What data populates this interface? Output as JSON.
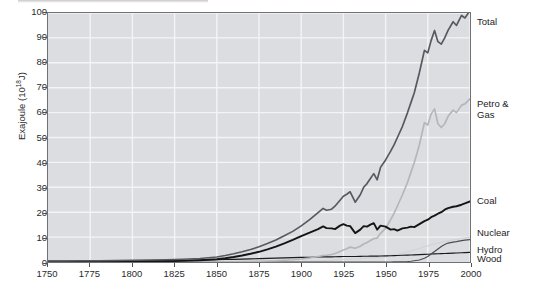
{
  "chart_data": {
    "type": "line",
    "title": "",
    "xlabel": "",
    "ylabel": "Exajoule (10",
    "ylabel_exponent": "18",
    "ylabel_suffix": "J)",
    "xlim": [
      1750,
      2000
    ],
    "ylim": [
      0,
      100
    ],
    "grid": true,
    "legend_position": "right-of-axes",
    "xticks": [
      "1750",
      "1775",
      "1800",
      "1825",
      "1850",
      "1875",
      "1900",
      "1925",
      "1950",
      "1975",
      "2000"
    ],
    "yticks": [
      "0",
      "10",
      "20",
      "30",
      "40",
      "50",
      "60",
      "70",
      "80",
      "90",
      "100"
    ],
    "x": [
      1750,
      1760,
      1770,
      1780,
      1790,
      1800,
      1810,
      1820,
      1830,
      1840,
      1850,
      1855,
      1860,
      1865,
      1870,
      1875,
      1880,
      1885,
      1890,
      1895,
      1900,
      1905,
      1910,
      1913,
      1915,
      1918,
      1920,
      1923,
      1925,
      1927,
      1929,
      1932,
      1935,
      1937,
      1939,
      1941,
      1943,
      1945,
      1947,
      1950,
      1953,
      1955,
      1957,
      1960,
      1963,
      1965,
      1967,
      1970,
      1973,
      1975,
      1977,
      1979,
      1981,
      1983,
      1985,
      1987,
      1990,
      1992,
      1995,
      1997,
      2000
    ],
    "series": [
      {
        "name": "Total",
        "color": "#565a60",
        "width": 1.7,
        "values": [
          0.4,
          0.4,
          0.5,
          0.5,
          0.6,
          0.7,
          0.8,
          0.9,
          1.1,
          1.4,
          2.0,
          2.6,
          3.3,
          4.1,
          5.0,
          6.1,
          7.4,
          8.8,
          10.5,
          12.3,
          14.5,
          17.0,
          19.8,
          21.5,
          20.8,
          21.2,
          22.4,
          24.8,
          26.4,
          27.2,
          28.2,
          24.0,
          27.0,
          30.0,
          31.5,
          33.5,
          35.5,
          33.0,
          38.0,
          41.0,
          44.5,
          47.0,
          50.0,
          54.5,
          60.0,
          64.0,
          68.0,
          76.0,
          85.0,
          84.0,
          89.0,
          93.0,
          88.5,
          87.5,
          90.0,
          93.0,
          96.5,
          95.0,
          99.0,
          98.0,
          101.0
        ]
      },
      {
        "name": "Petro & Gas",
        "color": "#b4b6ba",
        "width": 1.7,
        "values": [
          0,
          0,
          0,
          0,
          0,
          0,
          0,
          0,
          0,
          0,
          0.02,
          0.05,
          0.1,
          0.15,
          0.2,
          0.3,
          0.4,
          0.5,
          0.7,
          0.9,
          1.2,
          1.6,
          2.2,
          2.6,
          2.7,
          3.0,
          3.4,
          4.2,
          4.8,
          5.3,
          6.0,
          5.5,
          6.3,
          7.2,
          7.8,
          8.6,
          9.4,
          9.6,
          11.5,
          13.5,
          17.0,
          19.5,
          22.5,
          27.0,
          32.0,
          36.0,
          40.0,
          47.0,
          56.0,
          55.0,
          59.5,
          61.5,
          55.5,
          54.0,
          55.5,
          58.5,
          61.0,
          60.0,
          63.0,
          63.5,
          65.5
        ]
      },
      {
        "name": "Coal",
        "color": "#151515",
        "width": 1.9,
        "values": [
          0.05,
          0.06,
          0.08,
          0.1,
          0.12,
          0.16,
          0.22,
          0.3,
          0.45,
          0.7,
          1.1,
          1.5,
          2.0,
          2.6,
          3.3,
          4.1,
          5.1,
          6.2,
          7.5,
          8.9,
          10.4,
          11.8,
          13.2,
          14.3,
          13.6,
          13.5,
          13.2,
          14.6,
          15.2,
          14.6,
          14.4,
          11.6,
          13.0,
          14.4,
          14.2,
          15.0,
          15.6,
          13.0,
          14.6,
          14.2,
          13.0,
          13.2,
          12.6,
          13.5,
          13.8,
          14.2,
          14.0,
          15.2,
          16.4,
          17.0,
          18.0,
          18.6,
          19.4,
          20.0,
          21.0,
          21.6,
          22.2,
          22.4,
          23.0,
          23.5,
          24.3
        ]
      },
      {
        "name": "Nuclear",
        "color": "#4a4c50",
        "width": 1.2,
        "values": [
          0,
          0,
          0,
          0,
          0,
          0,
          0,
          0,
          0,
          0,
          0,
          0,
          0,
          0,
          0,
          0,
          0,
          0,
          0,
          0,
          0,
          0,
          0,
          0,
          0,
          0,
          0,
          0,
          0,
          0,
          0,
          0,
          0,
          0,
          0,
          0,
          0,
          0,
          0,
          0,
          0,
          0.02,
          0.05,
          0.1,
          0.2,
          0.3,
          0.5,
          0.8,
          1.5,
          2.2,
          3.2,
          4.2,
          5.2,
          6.2,
          7.0,
          7.6,
          8.0,
          8.2,
          8.6,
          8.8,
          9.0
        ]
      },
      {
        "name": "Hydro",
        "color": "#d3d4d7",
        "width": 1.3,
        "values": [
          0,
          0,
          0,
          0,
          0,
          0,
          0,
          0,
          0,
          0,
          0,
          0,
          0,
          0,
          0,
          0,
          0,
          0.02,
          0.05,
          0.1,
          0.2,
          0.3,
          0.45,
          0.55,
          0.6,
          0.7,
          0.8,
          0.95,
          1.05,
          1.15,
          1.25,
          1.2,
          1.35,
          1.5,
          1.6,
          1.7,
          1.8,
          1.8,
          2.0,
          2.2,
          2.6,
          2.9,
          3.2,
          3.6,
          4.1,
          4.5,
          4.9,
          5.4,
          6.1,
          6.5,
          6.9,
          7.3,
          7.6,
          7.9,
          8.2,
          8.5,
          8.9,
          9.1,
          9.5,
          9.7,
          10.0
        ]
      },
      {
        "name": "Wood",
        "color": "#1a1a1a",
        "width": 1.1,
        "values": [
          0.35,
          0.36,
          0.38,
          0.4,
          0.45,
          0.5,
          0.56,
          0.62,
          0.7,
          0.78,
          0.9,
          0.98,
          1.05,
          1.15,
          1.25,
          1.35,
          1.45,
          1.55,
          1.65,
          1.75,
          1.85,
          1.92,
          2.0,
          2.05,
          2.05,
          2.05,
          2.1,
          2.15,
          2.18,
          2.2,
          2.22,
          2.2,
          2.25,
          2.3,
          2.32,
          2.35,
          2.38,
          2.35,
          2.4,
          2.45,
          2.5,
          2.55,
          2.6,
          2.68,
          2.75,
          2.8,
          2.85,
          2.95,
          3.05,
          3.1,
          3.2,
          3.25,
          3.3,
          3.35,
          3.4,
          3.45,
          3.55,
          3.6,
          3.7,
          3.75,
          3.85
        ]
      }
    ],
    "series_labels": [
      {
        "name": "Total",
        "text": "Total",
        "top": 17
      },
      {
        "name": "Petro & Gas",
        "text": "Petro &\nGas",
        "top": 99
      },
      {
        "name": "Coal",
        "text": "Coal",
        "top": 196
      },
      {
        "name": "Nuclear",
        "text": "Nuclear",
        "top": 228
      },
      {
        "name": "Hydro",
        "text": "Hydro",
        "top": 245
      },
      {
        "name": "Wood",
        "text": "Wood",
        "top": 254
      }
    ],
    "colors": {
      "plot_background": "#dcdde0",
      "gridline": "#f4f4f5",
      "frame": "#6f7175",
      "text": "#2b2b2b"
    }
  }
}
